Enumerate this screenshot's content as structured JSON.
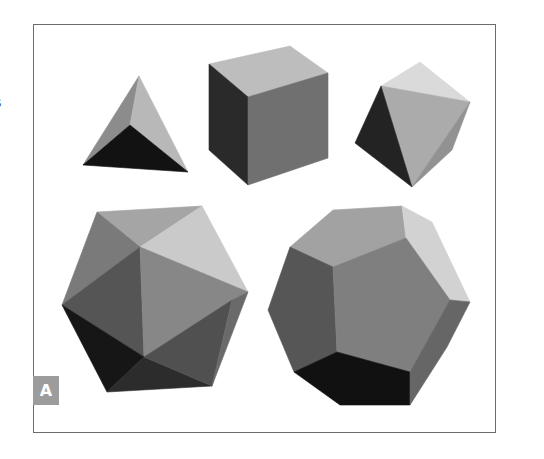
{
  "figure": {
    "panel_label": "A",
    "clipped_margin_text": "s",
    "frame_color": "#6b6b6b",
    "label_bg": "#9c9c9c",
    "solids": [
      {
        "name": "tetrahedron",
        "faces": [
          {
            "points": "139,76 83,165 130,125",
            "fill": "#8c8c8c"
          },
          {
            "points": "139,76 130,125 188,172",
            "fill": "#b8b8b8"
          },
          {
            "points": "83,165 130,125 188,172",
            "fill": "#121212"
          }
        ]
      },
      {
        "name": "cube",
        "faces": [
          {
            "points": "209,64 290,46 328,73 248,97",
            "fill": "#bdbdbd"
          },
          {
            "points": "209,64 248,97 248,185 209,150",
            "fill": "#2a2a2a"
          },
          {
            "points": "248,97 328,73 328,158 248,185",
            "fill": "#707070"
          }
        ]
      },
      {
        "name": "octahedron",
        "faces": [
          {
            "points": "420,62 381,86 470,102",
            "fill": "#dadada"
          },
          {
            "points": "381,86 470,102 412,187",
            "fill": "#ababab"
          },
          {
            "points": "381,86 355,143 412,187",
            "fill": "#232323"
          },
          {
            "points": "470,102 452,150 412,187",
            "fill": "#929292"
          }
        ]
      },
      {
        "name": "icosahedron",
        "faces": [
          {
            "points": "97,212 202,206 140,247",
            "fill": "#a5a5a5"
          },
          {
            "points": "202,206 248,292 140,247",
            "fill": "#cacaca"
          },
          {
            "points": "97,212 140,247 62,305",
            "fill": "#7a7a7a"
          },
          {
            "points": "140,247 62,305 144,357",
            "fill": "#555555"
          },
          {
            "points": "140,247 248,292 232,300 144,357",
            "fill": "#878787"
          },
          {
            "points": "62,305 144,357 107,392",
            "fill": "#161616"
          },
          {
            "points": "144,357 107,392 212,386",
            "fill": "#2c2c2c"
          },
          {
            "points": "144,357 232,300 212,386",
            "fill": "#505050"
          },
          {
            "points": "232,300 248,292 212,386",
            "fill": "#6a6a6a"
          }
        ]
      },
      {
        "name": "dodecahedron",
        "faces": [
          {
            "points": "290,247 333,210 402,206 406,238 333,267",
            "fill": "#a2a2a2"
          },
          {
            "points": "402,206 432,222 470,302 450,300 406,238",
            "fill": "#d2d2d2"
          },
          {
            "points": "290,247 333,267 337,352 294,372 268,310",
            "fill": "#565656"
          },
          {
            "points": "333,267 406,238 450,300 410,372 337,352",
            "fill": "#7f7f7f"
          },
          {
            "points": "294,372 337,352 410,372 410,405 340,405",
            "fill": "#111111"
          },
          {
            "points": "410,372 450,300 470,302 447,347 410,405",
            "fill": "#666666"
          }
        ]
      }
    ]
  }
}
